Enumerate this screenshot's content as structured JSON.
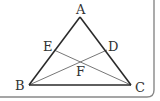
{
  "diagram": {
    "type": "geometry-triangle",
    "colors": {
      "outline": "#2a2a2a",
      "inner_lines": "#777777",
      "border": "#888888",
      "label": "#333333"
    },
    "points": {
      "A": {
        "label": "A",
        "x": 80,
        "y": 17
      },
      "B": {
        "label": "B",
        "x": 29,
        "y": 85
      },
      "C": {
        "label": "C",
        "x": 131,
        "y": 85
      },
      "D": {
        "label": "D",
        "x": 107,
        "y": 50
      },
      "E": {
        "label": "E",
        "x": 54,
        "y": 50
      },
      "F": {
        "label": "F",
        "x": 80,
        "y": 62
      }
    },
    "segments": [
      "AB",
      "BC",
      "CA",
      "BD",
      "CE"
    ]
  }
}
